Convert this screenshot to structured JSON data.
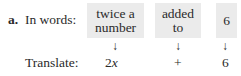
{
  "problem": {
    "label": "a.",
    "words_label": "In words:",
    "translate_label": "Translate:",
    "phrases": [
      {
        "line1": "twice a",
        "line2": "number",
        "translation_coef": "2",
        "translation_var": "x"
      },
      {
        "line1": "added",
        "line2": "to",
        "translation": "+"
      },
      {
        "line1": "6",
        "line2": "",
        "translation": "6"
      }
    ],
    "arrow_glyph": "↓",
    "box_color": "#ebebeb"
  }
}
